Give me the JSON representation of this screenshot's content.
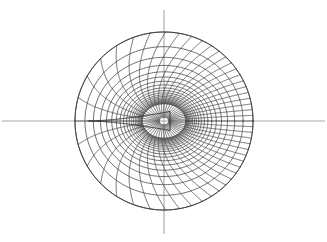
{
  "figure": {
    "background_color": "#ffffff",
    "width": 327,
    "height": 242
  },
  "axes": {
    "horizontal": {
      "name": "x-axis",
      "x1": 2,
      "y1": 121,
      "x2": 325,
      "y2": 121,
      "color": "#a8a8a8"
    },
    "vertical": {
      "name": "y-axis",
      "x1": 164,
      "y1": 10,
      "x2": 164,
      "y2": 234,
      "color": "#a8a8a8"
    }
  },
  "chart_data": {
    "type": "line",
    "xlabel": "",
    "ylabel": "",
    "grid": true,
    "legend_position": "none",
    "mapping": {
      "name": "joukowski-like",
      "center_x": 164,
      "center_y": 121,
      "outer_radius": 89,
      "focus_x": 253,
      "focus_y": 121,
      "cusp_tip_x": 88,
      "cusp_tip_y": 121,
      "source_center_offset": -0.118,
      "source_radius": 1.0,
      "scale": 89
    },
    "radial_line_count": 48,
    "circle_count": 22,
    "radial_angles_deg": [
      0,
      7.5,
      15,
      22.5,
      30,
      37.5,
      45,
      52.5,
      60,
      67.5,
      75,
      82.5,
      90,
      97.5,
      105,
      112.5,
      120,
      127.5,
      135,
      142.5,
      150,
      157.5,
      165,
      172.5,
      180,
      187.5,
      195,
      202.5,
      210,
      217.5,
      225,
      232.5,
      240,
      247.5,
      255,
      262.5,
      270,
      277.5,
      285,
      292.5,
      300,
      307.5,
      315,
      322.5,
      330,
      337.5,
      345,
      352.5
    ],
    "circle_radii": [
      1.0,
      1.02,
      1.045,
      1.075,
      1.11,
      1.15,
      1.2,
      1.26,
      1.33,
      1.41,
      1.5,
      1.61,
      1.73,
      1.87,
      2.03,
      2.21,
      2.42,
      2.66,
      2.94,
      3.27,
      3.66,
      4.12
    ],
    "curve_color": "#4a4a4a",
    "boundary_color": "#3a3a3a",
    "body_color": "#2a2a2a",
    "axis_color": "#a8a8a8",
    "line_width": 0.8,
    "xlim": [
      -4.2,
      4.2
    ],
    "ylim": [
      -3.1,
      3.1
    ]
  }
}
